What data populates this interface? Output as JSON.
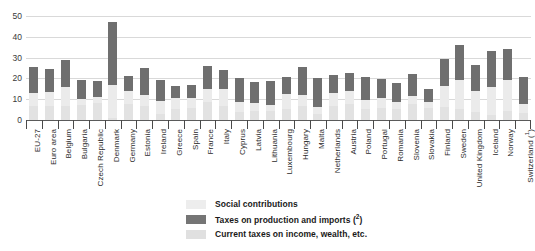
{
  "chart_data": {
    "type": "bar",
    "stacked": true,
    "title": "",
    "subtitle": "",
    "xlabel": "",
    "ylabel": "",
    "ylim": [
      0,
      50
    ],
    "yticks": [
      0,
      10,
      20,
      30,
      40,
      50
    ],
    "grid": true,
    "legend_position": "bottom",
    "categories": [
      "EU-27",
      "Euro area",
      "Belgium",
      "Bulgaria",
      "Czech Republic",
      "Denmark",
      "Germany",
      "Estonia",
      "Ireland",
      "Greece",
      "Spain",
      "France",
      "Italy",
      "Cyprus",
      "Latvia",
      "Lithuania",
      "Luxembourg",
      "Hungary",
      "Malta",
      "Netherlands",
      "Austria",
      "Poland",
      "Portugal",
      "Romania",
      "Slovenia",
      "Slovakia",
      "Finland",
      "Sweden",
      "United Kingdom",
      "Iceland",
      "Norway",
      "Switzerland (¹)"
    ],
    "series": [
      {
        "name": "Social contributions",
        "color": "#e2e2e2",
        "values": [
          6.5,
          6.8,
          6.8,
          7.0,
          8.0,
          1.0,
          7.5,
          6.8,
          3.0,
          5.5,
          6.0,
          8.5,
          6.8,
          4.0,
          4.5,
          4.5,
          5.5,
          6.5,
          3.0,
          6.8,
          7.5,
          5.5,
          6.0,
          5.5,
          7.5,
          6.0,
          6.3,
          5.5,
          3.8,
          2.5,
          4.5,
          3.2
        ]
      },
      {
        "name": "Current taxes on income, wealth, etc.",
        "color": "#ebebeb",
        "values": [
          6.5,
          6.5,
          9.2,
          3.0,
          3.0,
          16.0,
          6.5,
          5.2,
          6.0,
          5.0,
          4.5,
          6.5,
          8.2,
          4.5,
          3.5,
          2.5,
          7.0,
          5.5,
          3.5,
          6.0,
          6.5,
          4.0,
          4.5,
          3.0,
          4.0,
          2.5,
          10.0,
          13.5,
          10.2,
          13.5,
          14.5,
          4.3
        ]
      },
      {
        "name": "Taxes on production and imports (²)",
        "color": "#6f6f6f",
        "values": [
          12.6,
          11.2,
          12.8,
          9.3,
          8.0,
          30.0,
          7.0,
          13.0,
          10.3,
          6.0,
          6.3,
          10.8,
          9.0,
          11.5,
          10.5,
          12.0,
          8.0,
          13.5,
          13.5,
          9.0,
          8.5,
          11.0,
          9.0,
          9.5,
          10.5,
          6.5,
          13.0,
          17.0,
          12.3,
          17.0,
          15.0,
          13.0
        ]
      }
    ]
  },
  "legend": {
    "items": [
      {
        "label": "Social contributions",
        "swatch": "sw-social"
      },
      {
        "label": "Taxes on production and imports (²)",
        "swatch": "sw-prod"
      },
      {
        "label": "Current taxes on income, wealth, etc.",
        "swatch": "sw-income"
      }
    ]
  }
}
